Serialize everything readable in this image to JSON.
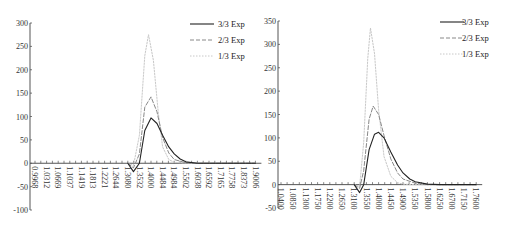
{
  "chart_data": [
    {
      "type": "line",
      "title": "",
      "xlabel": "",
      "ylabel": "",
      "ylim": [
        -100,
        300
      ],
      "yticks": [
        300,
        250,
        200,
        150,
        100,
        50,
        0,
        -50,
        -100
      ],
      "categories": [
        "0.9968",
        "1.0312",
        "1.0669",
        "1.1037",
        "1.1419",
        "1.1813",
        "1.2221",
        "1.2644",
        "1.3080",
        "1.3532",
        "1.4000",
        "1.4484",
        "1.4984",
        "1.5502",
        "1.6038",
        "1.6592",
        "1.7165",
        "1.7758",
        "1.8373",
        "1.9006"
      ],
      "x_labels_shown": [
        "0.9968",
        "1.0312",
        "1.0669",
        "1.1037",
        "1.1419",
        "1.1813",
        "1.2221",
        "1.2644",
        "1.3080",
        "1.3532",
        "1.4000",
        "1.4484",
        "1.4984",
        "1.5502",
        "1.6038",
        "1.6592",
        "1.7165",
        "1.7758",
        "1.8373",
        "1.9006"
      ],
      "legend_position": "top-right",
      "grid": false,
      "series": [
        {
          "name": "3/3 Exp",
          "style": "solid",
          "color": "#222222",
          "points": [
            [
              1.308,
              0
            ],
            [
              1.33,
              -18
            ],
            [
              1.3532,
              0
            ],
            [
              1.375,
              70
            ],
            [
              1.4,
              97
            ],
            [
              1.425,
              85
            ],
            [
              1.4484,
              60
            ],
            [
              1.475,
              35
            ],
            [
              1.4984,
              20
            ],
            [
              1.525,
              9
            ],
            [
              1.5502,
              3
            ],
            [
              1.6038,
              0
            ],
            [
              1.9006,
              0
            ]
          ]
        },
        {
          "name": "2/3 Exp",
          "style": "dashed",
          "color": "#888888",
          "points": [
            [
              1.308,
              0
            ],
            [
              1.33,
              -10
            ],
            [
              1.3532,
              20
            ],
            [
              1.375,
              120
            ],
            [
              1.4,
              142
            ],
            [
              1.425,
              110
            ],
            [
              1.4484,
              55
            ],
            [
              1.475,
              22
            ],
            [
              1.4984,
              8
            ],
            [
              1.5502,
              1
            ],
            [
              1.6038,
              0
            ],
            [
              1.9006,
              0
            ]
          ]
        },
        {
          "name": "1/3 Exp",
          "style": "dotted",
          "color": "#c8c8c8",
          "points": [
            [
              1.308,
              0
            ],
            [
              1.33,
              -5
            ],
            [
              1.3532,
              60
            ],
            [
              1.375,
              230
            ],
            [
              1.39,
              275
            ],
            [
              1.41,
              220
            ],
            [
              1.43,
              110
            ],
            [
              1.4484,
              35
            ],
            [
              1.475,
              8
            ],
            [
              1.4984,
              2
            ],
            [
              1.5502,
              0
            ],
            [
              1.9006,
              0
            ]
          ]
        }
      ]
    },
    {
      "type": "line",
      "title": "",
      "xlabel": "",
      "ylabel": "",
      "ylim": [
        -50,
        350
      ],
      "yticks": [
        350,
        300,
        250,
        200,
        150,
        100,
        50,
        0,
        -50
      ],
      "categories": [
        "1.0400",
        "1.0850",
        "1.1300",
        "1.1750",
        "1.2200",
        "1.2650",
        "1.3100",
        "1.3550",
        "1.4000",
        "1.4450",
        "1.4900",
        "1.5350",
        "1.5800",
        "1.6250",
        "1.6700",
        "1.7150",
        "1.7600"
      ],
      "x_labels_shown": [
        "1.0400",
        "1.0850",
        "1.1300",
        "1.1750",
        "1.2200",
        "1.2650",
        "1.3100",
        "1.3550",
        "1.4000",
        "1.4450",
        "1.4900",
        "1.5350",
        "1.5800",
        "1.6250",
        "1.6700",
        "1.7150",
        "1.7600"
      ],
      "legend_position": "top-right",
      "grid": false,
      "series": [
        {
          "name": "3/3 Exp",
          "style": "solid",
          "color": "#222222",
          "points": [
            [
              1.31,
              0
            ],
            [
              1.33,
              -17
            ],
            [
              1.345,
              0
            ],
            [
              1.365,
              75
            ],
            [
              1.385,
              108
            ],
            [
              1.4,
              112
            ],
            [
              1.42,
              100
            ],
            [
              1.445,
              70
            ],
            [
              1.47,
              42
            ],
            [
              1.49,
              25
            ],
            [
              1.515,
              12
            ],
            [
              1.535,
              6
            ],
            [
              1.58,
              1
            ],
            [
              1.625,
              0
            ],
            [
              1.76,
              0
            ]
          ]
        },
        {
          "name": "2/3 Exp",
          "style": "dashed",
          "color": "#888888",
          "points": [
            [
              1.31,
              0
            ],
            [
              1.33,
              -8
            ],
            [
              1.345,
              30
            ],
            [
              1.365,
              140
            ],
            [
              1.38,
              168
            ],
            [
              1.4,
              150
            ],
            [
              1.42,
              105
            ],
            [
              1.445,
              55
            ],
            [
              1.47,
              25
            ],
            [
              1.49,
              12
            ],
            [
              1.535,
              3
            ],
            [
              1.58,
              0
            ],
            [
              1.76,
              0
            ]
          ]
        },
        {
          "name": "1/3 Exp",
          "style": "dotted",
          "color": "#c8c8c8",
          "points": [
            [
              1.31,
              0
            ],
            [
              1.33,
              -4
            ],
            [
              1.345,
              90
            ],
            [
              1.36,
              270
            ],
            [
              1.37,
              335
            ],
            [
              1.385,
              280
            ],
            [
              1.4,
              160
            ],
            [
              1.42,
              60
            ],
            [
              1.445,
              18
            ],
            [
              1.47,
              4
            ],
            [
              1.49,
              1
            ],
            [
              1.535,
              0
            ],
            [
              1.76,
              0
            ]
          ]
        }
      ]
    }
  ]
}
